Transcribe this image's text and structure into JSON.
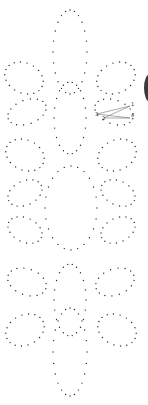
{
  "diagram": {
    "type": "dot-pattern",
    "dot_color": "#2a2a2a",
    "dot_radius": 0.7,
    "loops": [
      {
        "name": "top-teardrop",
        "cx": 70,
        "cy": 52,
        "rx": 17,
        "ry": 42,
        "dots": 24
      },
      {
        "name": "upper-left-petal-a",
        "cx": 24,
        "cy": 78,
        "rx": 20,
        "ry": 15,
        "rot": 25,
        "dots": 18
      },
      {
        "name": "upper-right-petal-a",
        "cx": 116,
        "cy": 78,
        "rx": 20,
        "ry": 15,
        "rot": -25,
        "dots": 18
      },
      {
        "name": "upper-left-petal-b",
        "cx": 27,
        "cy": 112,
        "rx": 20,
        "ry": 12,
        "rot": -20,
        "dots": 16
      },
      {
        "name": "upper-right-petal-b",
        "cx": 114,
        "cy": 112,
        "rx": 20,
        "ry": 12,
        "rot": 20,
        "dots": 16
      },
      {
        "name": "upper-center-oval",
        "cx": 70,
        "cy": 118,
        "rx": 16,
        "ry": 36,
        "dots": 22
      },
      {
        "name": "mid-left-petal-a",
        "cx": 25,
        "cy": 155,
        "rx": 20,
        "ry": 15,
        "rot": 25,
        "dots": 18
      },
      {
        "name": "mid-right-petal-a",
        "cx": 117,
        "cy": 155,
        "rx": 20,
        "ry": 15,
        "rot": -25,
        "dots": 18
      },
      {
        "name": "mid-left-petal-b",
        "cx": 25,
        "cy": 193,
        "rx": 18,
        "ry": 12,
        "rot": -25,
        "dots": 16
      },
      {
        "name": "mid-right-petal-b",
        "cx": 118,
        "cy": 193,
        "rx": 18,
        "ry": 12,
        "rot": 25,
        "dots": 16
      },
      {
        "name": "mid-left-petal-c",
        "cx": 25,
        "cy": 230,
        "rx": 18,
        "ry": 12,
        "rot": 25,
        "dots": 16
      },
      {
        "name": "mid-right-petal-c",
        "cx": 118,
        "cy": 230,
        "rx": 18,
        "ry": 12,
        "rot": -25,
        "dots": 16
      },
      {
        "name": "center-diamond",
        "cx": 71,
        "cy": 208,
        "rx": 26,
        "ry": 42,
        "dots": 24
      },
      {
        "name": "lower-left-petal-a",
        "cx": 27,
        "cy": 282,
        "rx": 20,
        "ry": 13,
        "rot": 20,
        "dots": 16
      },
      {
        "name": "lower-right-petal-a",
        "cx": 115,
        "cy": 282,
        "rx": 20,
        "ry": 13,
        "rot": -20,
        "dots": 16
      },
      {
        "name": "lower-center-oval",
        "cx": 70,
        "cy": 300,
        "rx": 16,
        "ry": 36,
        "dots": 22
      },
      {
        "name": "lower-left-petal-b",
        "cx": 25,
        "cy": 330,
        "rx": 20,
        "ry": 15,
        "rot": -25,
        "dots": 18
      },
      {
        "name": "lower-right-petal-b",
        "cx": 117,
        "cy": 330,
        "rx": 20,
        "ry": 15,
        "rot": 25,
        "dots": 18
      },
      {
        "name": "bottom-teardrop",
        "cx": 70,
        "cy": 352,
        "rx": 17,
        "ry": 44,
        "dots": 24
      }
    ],
    "stitch_example": {
      "lines": [
        [
          97,
          114,
          130,
          106
        ],
        [
          97,
          114,
          130,
          118
        ],
        [
          104,
          118,
          130,
          106
        ],
        [
          104,
          118,
          130,
          118
        ]
      ],
      "line_color": "#555555",
      "labels": [
        {
          "text": "1",
          "x": 131,
          "y": 106
        },
        {
          "text": "4",
          "x": 131,
          "y": 117
        },
        {
          "text": "3",
          "x": 95,
          "y": 116
        },
        {
          "text": "2",
          "x": 102,
          "y": 120
        }
      ]
    },
    "edge_shape": {
      "color": "#3a3a3a",
      "cx": 150,
      "cy": 88,
      "rx": 6,
      "ry": 14
    }
  }
}
